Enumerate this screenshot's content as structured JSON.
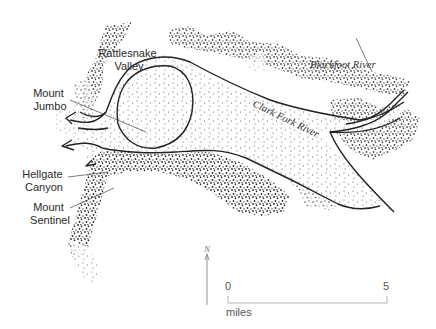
{
  "map": {
    "labels": {
      "rattlesnake_valley": [
        "Rattlesnake",
        "Valley"
      ],
      "mount_jumbo": [
        "Mount",
        "Jumbo"
      ],
      "hellgate_canyon": [
        "Hellgate",
        "Canyon"
      ],
      "mount_sentinel": [
        "Mount",
        "Sentinel"
      ],
      "blackfoot_river": "Blackfoot River",
      "clark_fork_river": "Clark Fork River"
    },
    "north_arrow": {
      "label": "N"
    },
    "scale_bar": {
      "start": "0",
      "end": "5",
      "unit": "miles"
    },
    "colors": {
      "ink": "#222222",
      "background": "#ffffff"
    }
  }
}
